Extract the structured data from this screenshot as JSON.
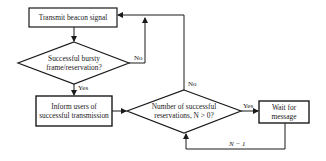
{
  "diagram": {
    "type": "flowchart",
    "nodes": {
      "transmit": {
        "line1": "Transmit beacon signal"
      },
      "decision1": {
        "line1": "Successful bursty",
        "line2": "frame/reservation?"
      },
      "inform": {
        "line1": "Inform users of",
        "line2": "successful transmission"
      },
      "decision2": {
        "line1": "Number of successful",
        "line2": "reservations, N > 0?"
      },
      "wait": {
        "line1": "Wait for",
        "line2": "message"
      }
    },
    "edges": {
      "d1_yes": "Yes",
      "d1_no": "No",
      "d2_yes": "Yes",
      "d2_no": "No",
      "loop": "N − 1"
    },
    "colors": {
      "stroke": "#1a1a1a",
      "background": "#ffffff"
    }
  }
}
